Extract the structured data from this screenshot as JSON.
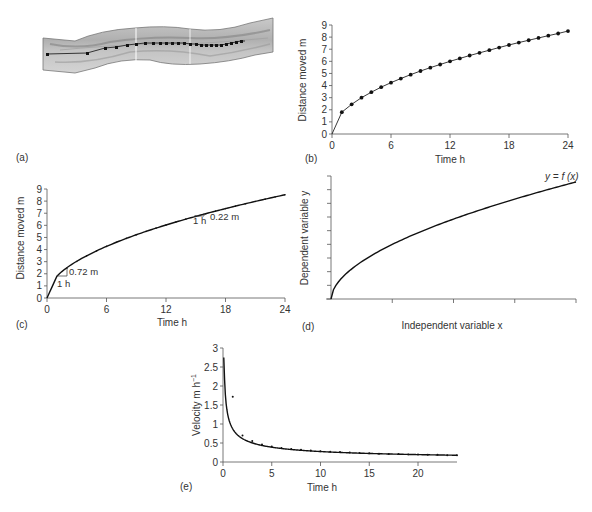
{
  "panels": {
    "a": {
      "label": "(a)"
    },
    "b": {
      "label": "(b)",
      "xlabel": "Time  h",
      "ylabel": "Distance moved m",
      "xticks": [
        "0",
        "6",
        "12",
        "18",
        "24"
      ],
      "yticks": [
        "0",
        "1",
        "2",
        "3",
        "4",
        "5",
        "6",
        "7",
        "8",
        "9"
      ]
    },
    "c": {
      "label": "(c)",
      "xlabel": "Time h",
      "ylabel": "Distance moved  m",
      "xticks": [
        "0",
        "6",
        "12",
        "18",
        "24"
      ],
      "yticks": [
        "0",
        "1",
        "2",
        "3",
        "4",
        "5",
        "6",
        "7",
        "8",
        "9"
      ],
      "annot1_dx": "1 h",
      "annot1_dy": "0.72 m",
      "annot2_dx": "1 h",
      "annot2_dy": "0.22 m"
    },
    "d": {
      "label": "(d)",
      "xlabel": "Independent variable x",
      "ylabel": "Dependent variable y",
      "curve_label": "y = f (x)"
    },
    "e": {
      "label": "(e)",
      "xlabel": "Time h",
      "ylabel": "Velocity  m h",
      "ylabel_sup": "−1",
      "xticks": [
        "0",
        "5",
        "10",
        "15",
        "20"
      ],
      "yticks": [
        "0",
        "0.5",
        "1",
        "1.5",
        "2",
        "2.5",
        "3"
      ]
    }
  },
  "chart_data": [
    {
      "panel": "b",
      "type": "line",
      "title": "",
      "xlabel": "Time h",
      "ylabel": "Distance moved m",
      "xlim": [
        0,
        24
      ],
      "ylim": [
        0,
        9
      ],
      "x": [
        0,
        1,
        2,
        3,
        4,
        5,
        6,
        7,
        8,
        9,
        10,
        11,
        12,
        13,
        14,
        15,
        16,
        17,
        18,
        19,
        20,
        21,
        22,
        23,
        24
      ],
      "series": [
        {
          "name": "distance",
          "values": [
            0,
            1.8,
            2.45,
            3.0,
            3.45,
            3.87,
            4.24,
            4.58,
            4.9,
            5.2,
            5.48,
            5.74,
            6.0,
            6.24,
            6.48,
            6.7,
            6.92,
            7.14,
            7.35,
            7.55,
            7.74,
            7.93,
            8.12,
            8.3,
            8.5
          ]
        }
      ]
    },
    {
      "panel": "c",
      "type": "line",
      "xlabel": "Time h",
      "ylabel": "Distance moved m",
      "xlim": [
        0,
        24
      ],
      "ylim": [
        0,
        9
      ],
      "annotations": [
        {
          "at_x": 1,
          "dx": "1 h",
          "dy": "0.72 m"
        },
        {
          "at_x": 15,
          "dx": "1 h",
          "dy": "0.22 m"
        }
      ]
    },
    {
      "panel": "d",
      "type": "line",
      "xlabel": "Independent variable x",
      "ylabel": "Dependent variable y",
      "curve": "y = f(x)",
      "shape": "sqrt-like concave increasing",
      "grid": false
    },
    {
      "panel": "e",
      "type": "line",
      "xlabel": "Time h",
      "ylabel": "Velocity m h^-1",
      "xlim": [
        0,
        24
      ],
      "ylim": [
        0,
        3
      ],
      "x": [
        1,
        2,
        3,
        4,
        5,
        6,
        7,
        8,
        9,
        10,
        11,
        12,
        13,
        14,
        15,
        16,
        17,
        18,
        19,
        20,
        21,
        22,
        23,
        24
      ],
      "series": [
        {
          "name": "velocity points",
          "values": [
            1.72,
            0.7,
            0.55,
            0.46,
            0.41,
            0.37,
            0.34,
            0.32,
            0.3,
            0.28,
            0.27,
            0.26,
            0.25,
            0.24,
            0.23,
            0.22,
            0.21,
            0.21,
            0.2,
            0.2,
            0.19,
            0.19,
            0.18,
            0.18
          ]
        }
      ]
    }
  ]
}
